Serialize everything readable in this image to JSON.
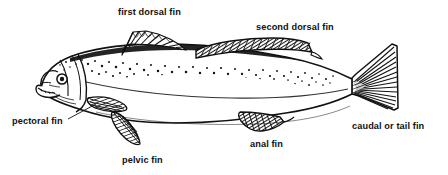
{
  "diagram": {
    "style": "black and white line drawing",
    "background_color": "#ffffff",
    "ink_color": "#111111",
    "labels": [
      {
        "id": "first-dorsal",
        "text": "first dorsal fin",
        "leader": false
      },
      {
        "id": "second-dorsal",
        "text": "second dorsal fin",
        "leader": false
      },
      {
        "id": "pectoral",
        "text": "pectoral fin",
        "leader": true
      },
      {
        "id": "pelvic",
        "text": "pelvic fin",
        "leader": false
      },
      {
        "id": "anal",
        "text": "anal fin",
        "leader": false
      },
      {
        "id": "caudal",
        "text": "caudal or tail fin",
        "leader": false
      }
    ]
  }
}
